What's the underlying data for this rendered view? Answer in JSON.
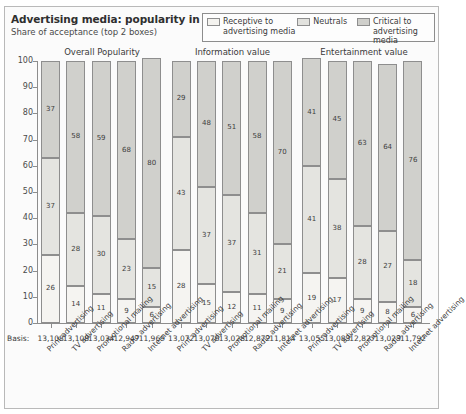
{
  "header": {
    "title": "Advertising media: popularity in %",
    "subtitle": "Share of acceptance (top 2 boxes)"
  },
  "legend": {
    "items": [
      {
        "name": "receptive",
        "line1": "Receptive to",
        "line2": "advertising media",
        "color": "#f5f4f1"
      },
      {
        "name": "neutrals",
        "line1": "Neutrals",
        "line2": "",
        "color": "#e4e4e0"
      },
      {
        "name": "critical",
        "line1": "Critical to",
        "line2": "advertising media",
        "color": "#d0d0cc"
      }
    ]
  },
  "basis": {
    "label": "Basis:"
  },
  "chart_data": {
    "type": "bar",
    "title": "Advertising media: popularity in %",
    "subtitle": "Share of acceptance (top 2 boxes)",
    "stacked": true,
    "stack_order_bottom_to_top": [
      "Receptive to advertising media",
      "Neutrals",
      "Critical to advertising media"
    ],
    "xlabel": "",
    "ylabel": "",
    "ylim": [
      0,
      100
    ],
    "yticks": [
      0,
      10,
      20,
      30,
      40,
      50,
      60,
      70,
      80,
      90,
      100
    ],
    "grid": false,
    "legend_position": "top-right",
    "categories": [
      "Print advertising",
      "TV advertising",
      "Promotional mailing",
      "Radio advertising",
      "Internet advertising"
    ],
    "panels": [
      {
        "title": "Overall Popularity",
        "series": [
          {
            "name": "Receptive to advertising media",
            "values": [
              26,
              14,
              11,
              9,
              6
            ]
          },
          {
            "name": "Neutrals",
            "values": [
              37,
              28,
              30,
              23,
              15
            ]
          },
          {
            "name": "Critical to advertising media",
            "values": [
              37,
              58,
              59,
              68,
              80
            ]
          }
        ],
        "basis": [
          "13,108",
          "13,108",
          "13,034",
          "12,947",
          "11,969"
        ]
      },
      {
        "title": "Information value",
        "series": [
          {
            "name": "Receptive to advertising media",
            "values": [
              28,
              15,
              12,
              11,
              9
            ]
          },
          {
            "name": "Neutrals",
            "values": [
              43,
              37,
              37,
              31,
              21
            ]
          },
          {
            "name": "Critical to advertising media",
            "values": [
              29,
              48,
              51,
              58,
              70
            ]
          }
        ],
        "basis": [
          "13,072",
          "13,076",
          "13,028",
          "12,872",
          "11,814"
        ]
      },
      {
        "title": "Entertainment value",
        "series": [
          {
            "name": "Receptive to advertising media",
            "values": [
              19,
              17,
              9,
              8,
              6
            ]
          },
          {
            "name": "Neutrals",
            "values": [
              41,
              38,
              28,
              27,
              18
            ]
          },
          {
            "name": "Critical to advertising media",
            "values": [
              41,
              45,
              63,
              64,
              76
            ]
          }
        ],
        "basis": [
          "13,055",
          "13,083",
          "12,827",
          "13,023",
          "11,792"
        ]
      }
    ]
  }
}
